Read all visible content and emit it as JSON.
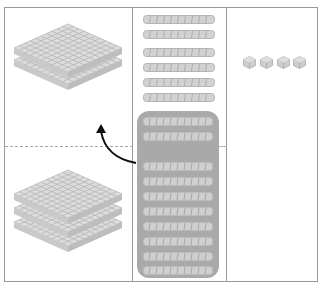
{
  "diagram": {
    "type": "base-ten-blocks-regrouping",
    "columns": [
      {
        "name": "hundreds",
        "top_region_flats": 2,
        "bottom_region_flats": 3
      },
      {
        "name": "tens",
        "loose_rods": 6,
        "grouped_rods": 10,
        "grouped_rods_split": [
          2,
          8
        ]
      },
      {
        "name": "ones",
        "cubes": 4
      }
    ],
    "arrow": {
      "from": "tens-group",
      "to": "hundreds-top",
      "meaning": "regroup 10 tens into 1 hundred"
    },
    "colors": {
      "frame": "#9a9a9a",
      "block_face": "#d9d9d9",
      "block_grid": "#b3b3b3",
      "group_box": "#a9a9a9",
      "arrow": "#111111"
    }
  }
}
